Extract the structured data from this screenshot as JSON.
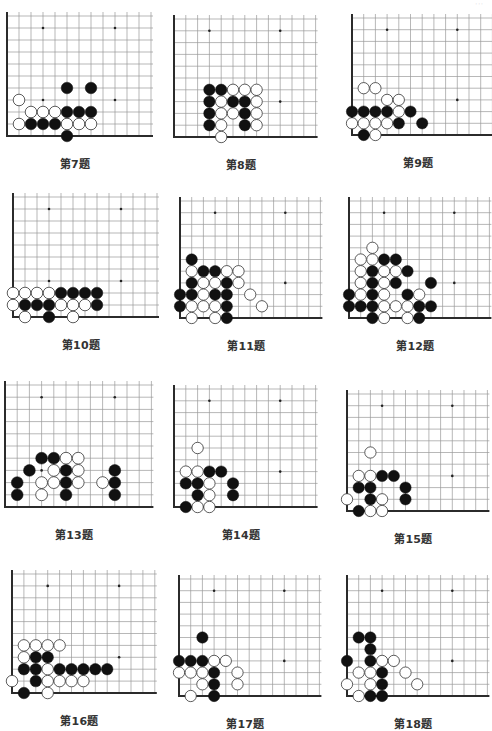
{
  "page": {
    "corner_mark": "···"
  },
  "board_style": {
    "line_color": "#9a9a9a",
    "edge_color": "#2b2b2b",
    "black_stone": "#111111",
    "white_stone": "#ffffff",
    "white_stroke": "#333333",
    "hoshi": "#222222",
    "columns": 13,
    "rows": 11,
    "hoshi_points": [
      [
        4,
        4
      ],
      [
        10,
        4
      ],
      [
        4,
        10
      ],
      [
        10,
        10
      ]
    ]
  },
  "problems": [
    {
      "label": "第7题",
      "left": 7,
      "bottom": 136,
      "spacing": 12.0,
      "black": [
        [
          6,
          5
        ],
        [
          8,
          5
        ],
        [
          6,
          3
        ],
        [
          7,
          3
        ],
        [
          8,
          3
        ],
        [
          3,
          2
        ],
        [
          4,
          2
        ],
        [
          5,
          2
        ],
        [
          6,
          1
        ]
      ],
      "white": [
        [
          2,
          4
        ],
        [
          3,
          3
        ],
        [
          4,
          3
        ],
        [
          5,
          3
        ],
        [
          2,
          2
        ],
        [
          6,
          2
        ],
        [
          7,
          2
        ],
        [
          8,
          2
        ]
      ]
    },
    {
      "label": "第8题",
      "left": 174,
      "bottom": 137,
      "spacing": 11.8,
      "black": [
        [
          4,
          5
        ],
        [
          5,
          5
        ],
        [
          4,
          4
        ],
        [
          6,
          4
        ],
        [
          7,
          4
        ],
        [
          4,
          3
        ],
        [
          7,
          3
        ],
        [
          4,
          2
        ],
        [
          7,
          2
        ]
      ],
      "white": [
        [
          6,
          5
        ],
        [
          7,
          5
        ],
        [
          8,
          5
        ],
        [
          5,
          4
        ],
        [
          8,
          4
        ],
        [
          5,
          3
        ],
        [
          6,
          3
        ],
        [
          8,
          3
        ],
        [
          5,
          2
        ],
        [
          8,
          2
        ],
        [
          5,
          1
        ]
      ]
    },
    {
      "label": "第9题",
      "left": 352,
      "bottom": 135,
      "spacing": 11.7,
      "black": [
        [
          1,
          3
        ],
        [
          2,
          3
        ],
        [
          3,
          3
        ],
        [
          4,
          3
        ],
        [
          6,
          3
        ],
        [
          5,
          2
        ],
        [
          7,
          2
        ],
        [
          2,
          1
        ]
      ],
      "white": [
        [
          2,
          5
        ],
        [
          3,
          5
        ],
        [
          4,
          4
        ],
        [
          5,
          4
        ],
        [
          5,
          3
        ],
        [
          1,
          2
        ],
        [
          2,
          2
        ],
        [
          3,
          2
        ],
        [
          4,
          2
        ],
        [
          3,
          1
        ]
      ]
    },
    {
      "label": "第10题",
      "left": 13,
      "bottom": 317,
      "spacing": 12.0,
      "black": [
        [
          5,
          3
        ],
        [
          6,
          3
        ],
        [
          7,
          3
        ],
        [
          8,
          3
        ],
        [
          2,
          2
        ],
        [
          3,
          2
        ],
        [
          4,
          2
        ],
        [
          8,
          2
        ],
        [
          4,
          1
        ]
      ],
      "white": [
        [
          1,
          3
        ],
        [
          2,
          3
        ],
        [
          3,
          3
        ],
        [
          4,
          3
        ],
        [
          1,
          2
        ],
        [
          5,
          2
        ],
        [
          6,
          2
        ],
        [
          7,
          2
        ],
        [
          2,
          1
        ],
        [
          6,
          1
        ]
      ]
    },
    {
      "label": "第11题",
      "left": 180,
      "bottom": 318,
      "spacing": 11.7,
      "black": [
        [
          2,
          6
        ],
        [
          3,
          5
        ],
        [
          4,
          5
        ],
        [
          2,
          4
        ],
        [
          5,
          4
        ],
        [
          1,
          3
        ],
        [
          2,
          3
        ],
        [
          4,
          3
        ],
        [
          5,
          3
        ],
        [
          1,
          2
        ],
        [
          5,
          2
        ],
        [
          5,
          1
        ]
      ],
      "white": [
        [
          2,
          5
        ],
        [
          5,
          5
        ],
        [
          6,
          5
        ],
        [
          3,
          4
        ],
        [
          4,
          4
        ],
        [
          6,
          4
        ],
        [
          3,
          3
        ],
        [
          7,
          3
        ],
        [
          2,
          2
        ],
        [
          3,
          2
        ],
        [
          4,
          2
        ],
        [
          8,
          2
        ],
        [
          2,
          1
        ],
        [
          4,
          1
        ]
      ]
    },
    {
      "label": "第12题",
      "left": 349,
      "bottom": 318,
      "spacing": 11.7,
      "black": [
        [
          4,
          6
        ],
        [
          5,
          6
        ],
        [
          3,
          5
        ],
        [
          6,
          5
        ],
        [
          3,
          4
        ],
        [
          5,
          4
        ],
        [
          8,
          4
        ],
        [
          1,
          3
        ],
        [
          3,
          3
        ],
        [
          6,
          3
        ],
        [
          1,
          2
        ],
        [
          2,
          2
        ],
        [
          3,
          2
        ],
        [
          7,
          2
        ],
        [
          8,
          2
        ],
        [
          3,
          1
        ],
        [
          7,
          1
        ]
      ],
      "white": [
        [
          3,
          7
        ],
        [
          2,
          6
        ],
        [
          3,
          6
        ],
        [
          2,
          5
        ],
        [
          4,
          5
        ],
        [
          5,
          5
        ],
        [
          2,
          4
        ],
        [
          4,
          4
        ],
        [
          2,
          3
        ],
        [
          4,
          3
        ],
        [
          7,
          3
        ],
        [
          4,
          2
        ],
        [
          5,
          2
        ],
        [
          6,
          2
        ],
        [
          4,
          1
        ],
        [
          6,
          1
        ]
      ]
    },
    {
      "label": "第13题",
      "left": 5,
      "bottom": 507,
      "spacing": 12.2,
      "black": [
        [
          4,
          5
        ],
        [
          5,
          5
        ],
        [
          3,
          4
        ],
        [
          6,
          4
        ],
        [
          10,
          4
        ],
        [
          2,
          3
        ],
        [
          6,
          3
        ],
        [
          10,
          3
        ],
        [
          2,
          2
        ],
        [
          6,
          2
        ],
        [
          10,
          2
        ]
      ],
      "white": [
        [
          6,
          5
        ],
        [
          7,
          5
        ],
        [
          5,
          4
        ],
        [
          7,
          4
        ],
        [
          4,
          3
        ],
        [
          5,
          3
        ],
        [
          7,
          3
        ],
        [
          9,
          3
        ],
        [
          4,
          2
        ]
      ]
    },
    {
      "label": "第14题",
      "left": 174,
      "bottom": 507,
      "spacing": 11.8,
      "black": [
        [
          4,
          4
        ],
        [
          5,
          4
        ],
        [
          2,
          3
        ],
        [
          3,
          3
        ],
        [
          6,
          3
        ],
        [
          3,
          2
        ],
        [
          6,
          2
        ],
        [
          2,
          1
        ]
      ],
      "white": [
        [
          3,
          6
        ],
        [
          2,
          4
        ],
        [
          3,
          4
        ],
        [
          4,
          3
        ],
        [
          4,
          2
        ],
        [
          3,
          1
        ],
        [
          4,
          1
        ]
      ]
    },
    {
      "label": "第15题",
      "left": 347,
      "bottom": 511,
      "spacing": 11.7,
      "black": [
        [
          4,
          4
        ],
        [
          5,
          4
        ],
        [
          2,
          3
        ],
        [
          3,
          3
        ],
        [
          6,
          3
        ],
        [
          3,
          2
        ],
        [
          6,
          2
        ],
        [
          2,
          1
        ]
      ],
      "white": [
        [
          3,
          6
        ],
        [
          2,
          4
        ],
        [
          3,
          4
        ],
        [
          1,
          2
        ],
        [
          4,
          2
        ],
        [
          3,
          1
        ],
        [
          4,
          1
        ]
      ]
    },
    {
      "label": "第16题",
      "left": 12,
      "bottom": 693,
      "spacing": 11.9,
      "black": [
        [
          3,
          4
        ],
        [
          4,
          4
        ],
        [
          2,
          3
        ],
        [
          3,
          3
        ],
        [
          5,
          3
        ],
        [
          6,
          3
        ],
        [
          7,
          3
        ],
        [
          8,
          3
        ],
        [
          9,
          3
        ],
        [
          3,
          2
        ],
        [
          2,
          1
        ]
      ],
      "white": [
        [
          2,
          5
        ],
        [
          3,
          5
        ],
        [
          4,
          5
        ],
        [
          5,
          5
        ],
        [
          2,
          4
        ],
        [
          4,
          3
        ],
        [
          1,
          2
        ],
        [
          4,
          2
        ],
        [
          5,
          2
        ],
        [
          6,
          2
        ],
        [
          7,
          2
        ],
        [
          4,
          1
        ]
      ]
    },
    {
      "label": "第17题",
      "left": 179,
      "bottom": 696,
      "spacing": 11.7,
      "black": [
        [
          3,
          6
        ],
        [
          1,
          4
        ],
        [
          2,
          4
        ],
        [
          3,
          4
        ],
        [
          4,
          3
        ],
        [
          4,
          2
        ],
        [
          4,
          1
        ]
      ],
      "white": [
        [
          4,
          4
        ],
        [
          5,
          4
        ],
        [
          1,
          3
        ],
        [
          2,
          3
        ],
        [
          3,
          3
        ],
        [
          6,
          3
        ],
        [
          3,
          2
        ],
        [
          6,
          2
        ],
        [
          2,
          1
        ]
      ]
    },
    {
      "label": "第18题",
      "left": 347,
      "bottom": 696,
      "spacing": 11.7,
      "black": [
        [
          2,
          6
        ],
        [
          3,
          6
        ],
        [
          3,
          5
        ],
        [
          1,
          4
        ],
        [
          3,
          4
        ],
        [
          4,
          3
        ],
        [
          4,
          2
        ],
        [
          3,
          1
        ],
        [
          4,
          1
        ]
      ],
      "white": [
        [
          4,
          4
        ],
        [
          5,
          4
        ],
        [
          2,
          3
        ],
        [
          3,
          3
        ],
        [
          6,
          3
        ],
        [
          1,
          2
        ],
        [
          3,
          2
        ],
        [
          7,
          2
        ],
        [
          2,
          1
        ]
      ]
    }
  ]
}
